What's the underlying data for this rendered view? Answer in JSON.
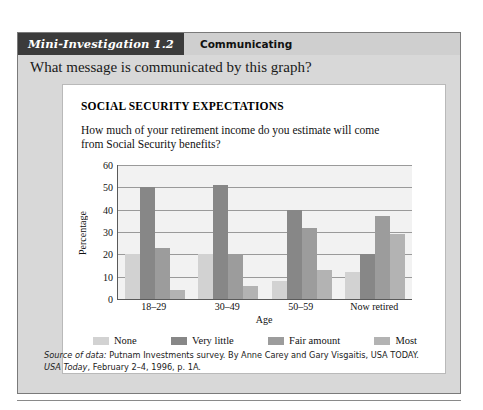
{
  "investigation": {
    "tag": "Mini-Investigation 1.2",
    "section": "Communicating",
    "question": "What message is communicated by this graph?"
  },
  "figure": {
    "title": "SOCIAL SECURITY EXPECTATIONS",
    "subtitle": "How much of your retirement income do you estimate will come from Social Security benefits?"
  },
  "source": {
    "label": "Source of data:",
    "text_part1": " Putnam Investments survey. By Anne Carey and Gary Visgaitis, USA TODAY. ",
    "publication": "USA Today",
    "text_part2": ", February 2–4, 1996, p. 1A."
  },
  "colors": {
    "none": "#d2d2d2",
    "very_little": "#878787",
    "fair_amount": "#9c9c9c",
    "most": "#b3b3b3",
    "plot_background": "#f2f2f2",
    "gridline": "#9a9a9a",
    "axis": "#5a5a5a",
    "header_tag_background": "#3b3b3b",
    "panel_background": "#d8d8d8"
  },
  "chart_data": {
    "type": "bar",
    "title": "SOCIAL SECURITY EXPECTATIONS",
    "subtitle": "How much of your retirement income do you estimate will come from Social Security benefits?",
    "xlabel": "Age",
    "ylabel": "Percentage",
    "ylim": [
      0,
      60
    ],
    "yticks": [
      0,
      10,
      20,
      30,
      40,
      50,
      60
    ],
    "grid": true,
    "legend_position": "bottom",
    "categories": [
      "18–29",
      "30–49",
      "50–59",
      "Now retired"
    ],
    "series": [
      {
        "name": "None",
        "color": "#d2d2d2",
        "values": [
          20,
          20,
          8,
          12
        ]
      },
      {
        "name": "Very little",
        "color": "#878787",
        "values": [
          50,
          51,
          40,
          20
        ]
      },
      {
        "name": "Fair amount",
        "color": "#9c9c9c",
        "values": [
          23,
          20,
          32,
          37
        ]
      },
      {
        "name": "Most",
        "color": "#b3b3b3",
        "values": [
          4,
          6,
          13,
          29
        ]
      }
    ]
  }
}
